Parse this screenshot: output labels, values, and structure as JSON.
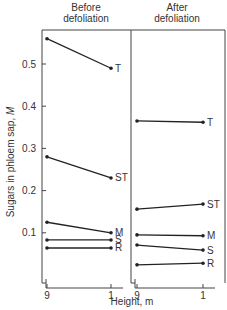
{
  "chart_data": {
    "type": "line",
    "title": "",
    "ylabel": "Sugars in phloem sap, M",
    "ylabel_main": "Sugars in phloem sap, ",
    "ylabel_unit": "M",
    "xlabel": "Height, m",
    "ylim": [
      0,
      0.6
    ],
    "yticks": [
      0.1,
      0.2,
      0.3,
      0.4,
      0.5
    ],
    "ytick_labels": [
      "0.1",
      "0.2",
      "0.3",
      "0.4",
      "0.5"
    ],
    "grid": false,
    "legend_position": "inline labels at right end of each line",
    "panels": [
      {
        "title_line1": "Before",
        "title_line2": "defoliation",
        "x": [
          9,
          1
        ],
        "xtick_labels": [
          "9",
          "1"
        ],
        "series": [
          {
            "name": "T",
            "values": [
              0.56,
              0.49
            ]
          },
          {
            "name": "ST",
            "values": [
              0.28,
              0.23
            ]
          },
          {
            "name": "M",
            "values": [
              0.125,
              0.1
            ]
          },
          {
            "name": "S",
            "values": [
              0.083,
              0.083
            ]
          },
          {
            "name": "R",
            "values": [
              0.064,
              0.064
            ]
          }
        ]
      },
      {
        "title_line1": "After",
        "title_line2": "defoliation",
        "x": [
          9,
          1
        ],
        "xtick_labels": [
          "9",
          "1"
        ],
        "series": [
          {
            "name": "T",
            "values": [
              0.365,
              0.362
            ]
          },
          {
            "name": "ST",
            "values": [
              0.156,
              0.168
            ]
          },
          {
            "name": "M",
            "values": [
              0.095,
              0.093
            ]
          },
          {
            "name": "S",
            "values": [
              0.071,
              0.059
            ]
          },
          {
            "name": "R",
            "values": [
              0.024,
              0.028
            ]
          }
        ]
      }
    ]
  },
  "colors": {
    "line": "#222222",
    "axis": "#444444"
  }
}
